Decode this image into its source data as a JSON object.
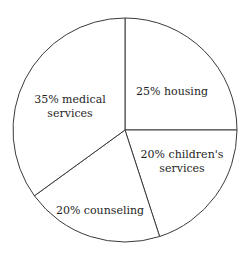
{
  "chart_data": {
    "type": "pie",
    "title": "",
    "start_angle": "top",
    "direction": "clockwise",
    "slices": [
      {
        "label": "housing",
        "value": 25,
        "text_lines": [
          "25% housing"
        ]
      },
      {
        "label": "children's services",
        "value": 20,
        "text_lines": [
          "20% children's",
          "services"
        ]
      },
      {
        "label": "counseling",
        "value": 20,
        "text_lines": [
          "20% counseling"
        ]
      },
      {
        "label": "medical services",
        "value": 35,
        "text_lines": [
          "35% medical",
          "services"
        ]
      }
    ],
    "colors": {
      "fill": "#ffffff",
      "stroke": "#3a3a3a",
      "text": "#1e1e1e"
    }
  }
}
